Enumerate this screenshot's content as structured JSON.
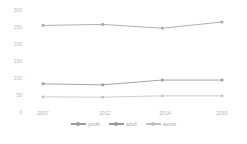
{
  "chart_data": {
    "type": "line",
    "title": "",
    "xlabel": "",
    "ylabel": "",
    "categories": [
      "2007",
      "2012",
      "2014",
      "2015"
    ],
    "ylim": [
      0,
      300
    ],
    "yticks": [
      300,
      250,
      200,
      150,
      100,
      50,
      0
    ],
    "grid": false,
    "legend_position": "bottom",
    "series": [
      {
        "name": "youth",
        "color": "#c6c6c6",
        "values": [
          47,
          46,
          50,
          50
        ]
      },
      {
        "name": "adult",
        "color": "#9a9a9a",
        "values": [
          85,
          82,
          96,
          96
        ]
      },
      {
        "name": "senior",
        "color": "#a8a8a8",
        "values": [
          255,
          258,
          247,
          265
        ]
      }
    ]
  },
  "axis": {
    "y_tick_labels": [
      "300",
      "250",
      "200",
      "150",
      "100",
      "50",
      "0"
    ],
    "x_tick_labels": [
      "2007",
      "2012",
      "2014",
      "2015"
    ]
  },
  "legend": {
    "items": [
      {
        "label": "youth",
        "color": "#9a9a9a"
      },
      {
        "label": "adult",
        "color": "#9a9a9a"
      },
      {
        "label": "senior",
        "color": "#c0c0c0"
      }
    ]
  },
  "watermark": {
    "text": ""
  }
}
